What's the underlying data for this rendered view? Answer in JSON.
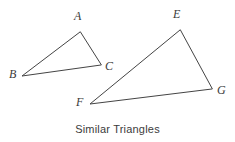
{
  "figure": {
    "caption": "Similar Triangles",
    "background_color": "#ffffff",
    "stroke_color": "#444444",
    "label_color": "#3a3a3a",
    "width": 235,
    "height": 142,
    "triangles": [
      {
        "id": "ABC",
        "name": "small-triangle",
        "vertices": [
          {
            "label": "A",
            "x": 80,
            "y": 32,
            "label_x": 74,
            "label_y": 10
          },
          {
            "label": "B",
            "x": 22,
            "y": 76,
            "label_x": 9,
            "label_y": 68
          },
          {
            "label": "C",
            "x": 101,
            "y": 65,
            "label_x": 105,
            "label_y": 60
          }
        ],
        "path": "M 80 32 L 22 76 L 101 65 Z"
      },
      {
        "id": "EFG",
        "name": "large-triangle",
        "vertices": [
          {
            "label": "E",
            "x": 180,
            "y": 30,
            "label_x": 173,
            "label_y": 8
          },
          {
            "label": "F",
            "x": 90,
            "y": 104,
            "label_x": 76,
            "label_y": 96
          },
          {
            "label": "G",
            "x": 212,
            "y": 89,
            "label_x": 217,
            "label_y": 84
          }
        ],
        "path": "M 180 30 L 90 104 L 212 89 Z"
      }
    ]
  }
}
